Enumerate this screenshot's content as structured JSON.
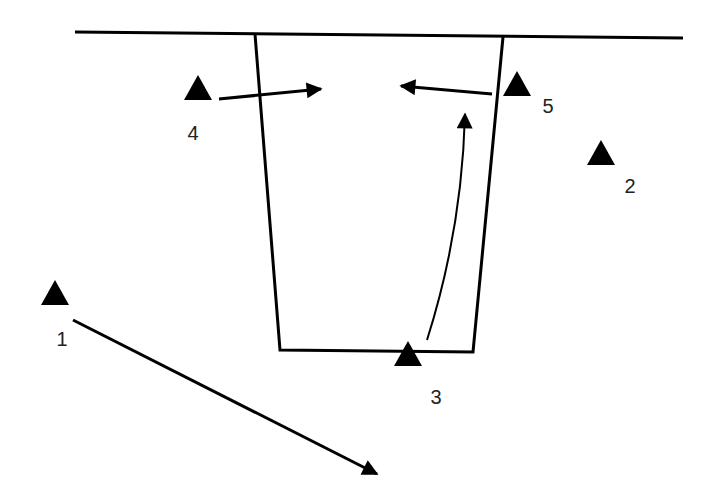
{
  "diagram": {
    "title": "",
    "colors": {
      "line": "#000000",
      "text": "#222222",
      "background": "#ffffff"
    },
    "ground_line": {
      "x1": 75,
      "y1": 32,
      "x2": 683,
      "y2": 38
    },
    "pit": {
      "points": [
        [
          255,
          34
        ],
        [
          280,
          350
        ],
        [
          473,
          352
        ],
        [
          503,
          37
        ]
      ],
      "description": "trapezoidal pit/trench cross-section"
    },
    "stations": [
      {
        "id": "1",
        "label": "1",
        "tri": [
          55,
          305
        ],
        "text": [
          62,
          346
        ]
      },
      {
        "id": "2",
        "label": "2",
        "tri": [
          601,
          165
        ],
        "text": [
          630,
          193
        ]
      },
      {
        "id": "3",
        "label": "3",
        "tri": [
          408,
          366
        ],
        "text": [
          436,
          404
        ]
      },
      {
        "id": "4",
        "label": "4",
        "tri": [
          198,
          100
        ],
        "text": [
          193,
          140
        ]
      },
      {
        "id": "5",
        "label": "5",
        "tri": [
          517,
          96
        ],
        "text": [
          548,
          113
        ]
      }
    ],
    "arrows": [
      {
        "id": "arrow-from-1",
        "type": "straight",
        "from": [
          73,
          320
        ],
        "to": [
          377,
          474
        ]
      },
      {
        "id": "arrow-from-4",
        "type": "straight",
        "from": [
          219,
          99
        ],
        "to": [
          321,
          89
        ]
      },
      {
        "id": "arrow-from-5",
        "type": "straight",
        "from": [
          492,
          94
        ],
        "to": [
          401,
          86
        ]
      },
      {
        "id": "arrow-from-3",
        "type": "curved",
        "path": "M 427 340 Q 462 230 465 114"
      }
    ]
  }
}
